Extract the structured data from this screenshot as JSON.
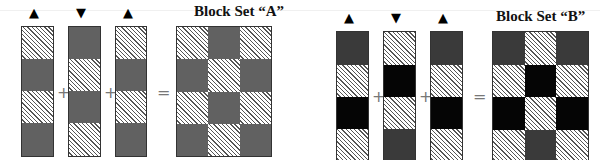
{
  "sets": [
    {
      "title": "Block Set “A”",
      "arrows": [
        "▲",
        "▼",
        "▲"
      ],
      "operators": [
        "+",
        "+",
        "="
      ],
      "columns": [
        [
          "hatched",
          "gray",
          "hatched",
          "gray"
        ],
        [
          "gray",
          "hatched",
          "gray",
          "hatched"
        ],
        [
          "hatched",
          "gray",
          "hatched",
          "gray"
        ]
      ],
      "result_grid": [
        [
          "hatched",
          "gray",
          "hatched"
        ],
        [
          "gray",
          "hatched",
          "gray"
        ],
        [
          "hatched",
          "gray",
          "hatched"
        ],
        [
          "gray",
          "hatched",
          "gray"
        ]
      ]
    },
    {
      "title": "Block Set “B”",
      "arrows": [
        "▲",
        "▼",
        "▲"
      ],
      "operators": [
        "+",
        "+",
        "="
      ],
      "columns": [
        [
          "dark",
          "hatched",
          "black",
          "hatched"
        ],
        [
          "hatched",
          "black",
          "hatched",
          "dark"
        ],
        [
          "dark",
          "hatched",
          "black",
          "hatched"
        ]
      ],
      "result_grid": [
        [
          "dark",
          "hatched",
          "dark"
        ],
        [
          "hatched",
          "black",
          "hatched"
        ],
        [
          "black",
          "hatched",
          "black"
        ],
        [
          "hatched",
          "dark",
          "hatched"
        ]
      ]
    }
  ]
}
